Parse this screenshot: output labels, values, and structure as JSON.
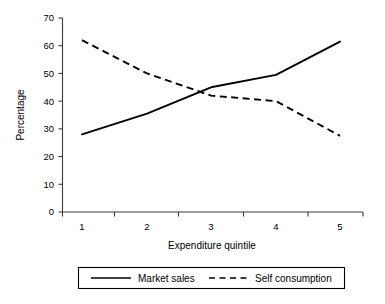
{
  "chart_data": {
    "type": "line",
    "title": "",
    "xlabel": "Expenditure quintile",
    "ylabel": "Percentage",
    "categories": [
      "1",
      "2",
      "3",
      "4",
      "5"
    ],
    "x": [
      1,
      2,
      3,
      4,
      5
    ],
    "xlim": [
      0.5,
      5.5
    ],
    "ylim": [
      0,
      70
    ],
    "yticks": [
      0,
      10,
      20,
      30,
      40,
      50,
      60,
      70
    ],
    "ytick_labels": [
      "0",
      "10",
      "20",
      "30",
      "40",
      "50",
      "60",
      "70"
    ],
    "xtick_labels": [
      "1",
      "2",
      "3",
      "4",
      "5"
    ],
    "grid": false,
    "legend_position": "bottom",
    "series": [
      {
        "name": "Market sales",
        "style": "solid",
        "color": "#000000",
        "values": [
          28,
          35.5,
          45,
          49.5,
          61.5
        ]
      },
      {
        "name": "Self consumption",
        "style": "dashed",
        "color": "#000000",
        "values": [
          62,
          50,
          42,
          40,
          27.5
        ]
      }
    ]
  },
  "legend": {
    "items": [
      {
        "label": "Market sales",
        "style": "solid"
      },
      {
        "label": "Self consumption",
        "style": "dashed"
      }
    ]
  },
  "colors": {
    "axis": "#3a3a3a",
    "line": "#000000",
    "background": "#ffffff"
  }
}
